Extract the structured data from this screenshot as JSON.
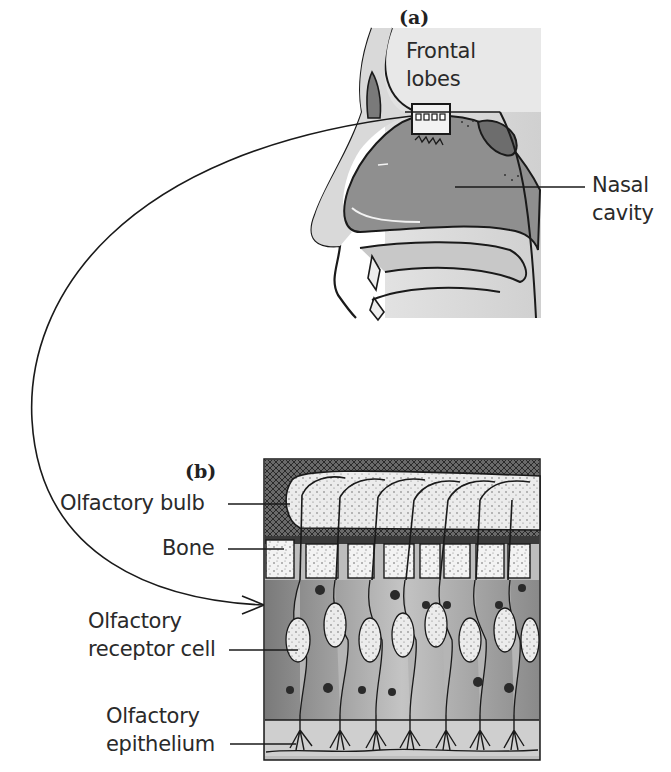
{
  "figure": {
    "panel_a": {
      "tag": "(a)",
      "labels": {
        "frontal_lobes_line1": "Frontal",
        "frontal_lobes_line2": "lobes",
        "nasal_cavity_line1": "Nasal",
        "nasal_cavity_line2": "cavity"
      }
    },
    "panel_b": {
      "tag": "(b)",
      "labels": {
        "olfactory_bulb": "Olfactory bulb",
        "bone": "Bone",
        "receptor_line1": "Olfactory",
        "receptor_line2": "receptor cell",
        "epithelium_line1": "Olfactory",
        "epithelium_line2": "epithelium"
      }
    },
    "colors": {
      "line": "#1a1a1a",
      "skin_fill": "#d9d9d9",
      "cavity_fill": "#8f8f8f",
      "brain_fill": "#e6e6e6",
      "bone_fill": "#f0f0f0",
      "bulb_fill": "#e8e8e8",
      "cell_fill": "#a8a8a8",
      "background": "#ffffff"
    }
  }
}
